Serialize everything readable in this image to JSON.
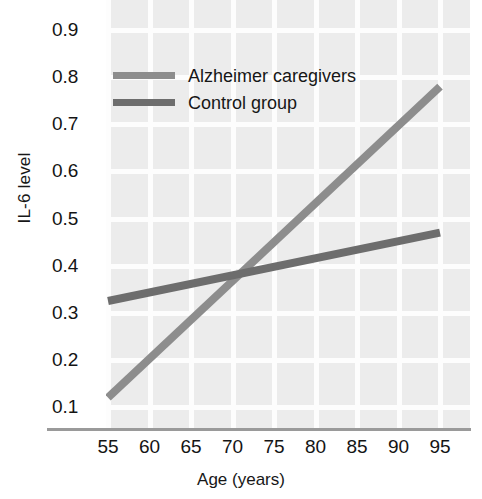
{
  "chart_data": {
    "type": "line",
    "title": "",
    "xlabel": "Age (years)",
    "ylabel": "IL-6 level",
    "xlim": [
      53,
      97
    ],
    "ylim": [
      0.06,
      0.95
    ],
    "xticks": [
      55,
      60,
      65,
      70,
      75,
      80,
      85,
      90,
      95
    ],
    "yticks": [
      0.1,
      0.2,
      0.3,
      0.4,
      0.5,
      0.6,
      0.7,
      0.8,
      0.9
    ],
    "xtick_labels": [
      "55",
      "60",
      "65",
      "70",
      "75",
      "80",
      "85",
      "90",
      "95"
    ],
    "ytick_labels": [
      "0.9",
      "0.8",
      "0.7",
      "0.6",
      "0.5",
      "0.4",
      "0.3",
      "0.2",
      "0.1"
    ],
    "grid": true,
    "grid_color": "#fdfdfd",
    "plot_background": "#ececec",
    "legend_position": "upper left",
    "series": [
      {
        "name": "Alzheimer caregivers",
        "color": "#8d8d8d",
        "x": [
          55,
          95
        ],
        "values": [
          0.12,
          0.78
        ],
        "line_width": 8
      },
      {
        "name": "Control group",
        "color": "#6d6d6d",
        "x": [
          55,
          95
        ],
        "values": [
          0.325,
          0.47
        ],
        "line_width": 8
      }
    ],
    "annotations": {
      "intersection_age": 71,
      "intersection_value": 0.385
    }
  },
  "axes": {
    "y_title": "IL-6 level",
    "x_title": "Age (years)"
  },
  "legend": {
    "items": [
      {
        "label": "Alzheimer caregivers",
        "color": "#8d8d8d"
      },
      {
        "label": "Control group",
        "color": "#6d6d6d"
      }
    ]
  }
}
